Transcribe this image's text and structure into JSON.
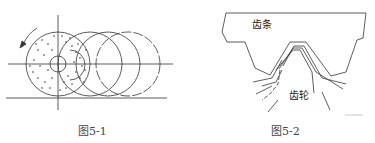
{
  "figures": [
    {
      "id": "fig-5-1",
      "caption": "图5-1",
      "description": "Grinding wheel (dotted abrasive disc with center hole) rolling along a line, shown in successive positions with a counter-clockwise rotation arrow"
    },
    {
      "id": "fig-5-2",
      "caption": "图5-2",
      "labels": {
        "rack": "齿条",
        "gear": "齿轮"
      },
      "description": "Rack tooth space with gear tooth profiles enveloped in successive positions"
    }
  ]
}
